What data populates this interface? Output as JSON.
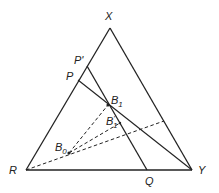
{
  "diagram": {
    "type": "ternary-phase-triangle",
    "colors": {
      "line": "#222222",
      "background": "#ffffff"
    },
    "vertices": {
      "X": {
        "label": "X",
        "x": 110,
        "y": 28
      },
      "R": {
        "label": "R",
        "x": 26,
        "y": 170
      },
      "Y": {
        "label": "Y",
        "x": 192,
        "y": 170
      }
    },
    "points": {
      "P_prime": {
        "label": "P",
        "mark": "'",
        "x": 87,
        "y": 66
      },
      "P": {
        "label": "P",
        "x": 78,
        "y": 80
      },
      "Q": {
        "label": "Q",
        "x": 147,
        "y": 170
      },
      "B1": {
        "label": "B",
        "sub": "1",
        "x": 108,
        "y": 105
      },
      "B1_prime": {
        "label": "B",
        "sub": "1",
        "mark": "'",
        "x": 120,
        "y": 123
      },
      "B0": {
        "label": "B",
        "sub": "0",
        "x": 69,
        "y": 153
      }
    },
    "solid_lines": [
      {
        "name": "side-xr",
        "from": "X",
        "to": "R"
      },
      {
        "name": "side-xy",
        "from": "X",
        "to": "Y"
      },
      {
        "name": "side-ry",
        "from": "R",
        "to": "Y"
      },
      {
        "name": "line-pprime-q",
        "from": "P_prime",
        "to": "Q"
      },
      {
        "name": "line-p-y",
        "from": "P",
        "to": "Y"
      }
    ],
    "dashed_lines": [
      {
        "name": "dash-b0-b1",
        "from": "B0",
        "to": "B1"
      },
      {
        "name": "dash-b0-b1prime",
        "from": "B0",
        "to": "B1_prime"
      },
      {
        "name": "dash-r-side",
        "from": "R",
        "to": "side-xy",
        "x2": 164,
        "y2": 121
      }
    ],
    "labels": {
      "X": "X",
      "R": "R",
      "Y": "Y",
      "Q": "Q",
      "P": "P",
      "P_prime": "P'",
      "B1": "B",
      "B1_sub": "1",
      "B1p": "B",
      "B1p_sub": "1",
      "B1p_mark": "'",
      "B0": "B",
      "B0_sub": "0"
    }
  }
}
